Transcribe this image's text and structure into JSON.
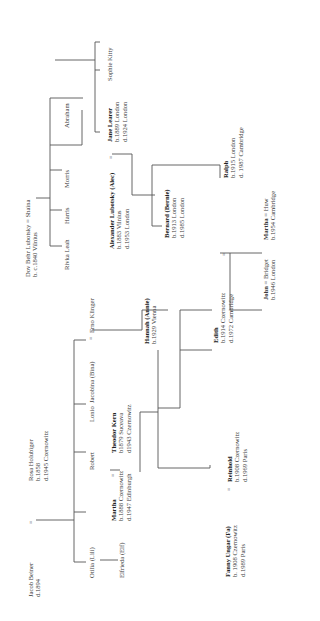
{
  "diagram": {
    "type": "family-tree",
    "orientation": "rotated-90-ccw",
    "persons": {
      "jacob_beiner": {
        "name": "Jacob Beiner",
        "lines": [
          "d.1894"
        ]
      },
      "rosa_holubiger": {
        "name": "Rosa Holubiger",
        "lines": [
          "b.1858",
          "d.1945 Czernowitz"
        ]
      },
      "otilia": {
        "name": "Otilia (Lili)",
        "lines": []
      },
      "elfrieda": {
        "name": "Elfrieda (Elf)",
        "lines": []
      },
      "martha": {
        "name": "Martha",
        "lines": [
          "b.1888 Czernowitz",
          "d.1947 Edinburgh"
        ]
      },
      "robert": {
        "name": "Robert",
        "lines": []
      },
      "lonio": {
        "name": "Lonio",
        "lines": []
      },
      "jacobina": {
        "name": "Jacobina (Bina)",
        "lines": []
      },
      "theodor_kern": {
        "name": "Theodor Kern",
        "lines": [
          "b1879 Suceava",
          "d1943 Czernowitz"
        ]
      },
      "erno_klinger": {
        "name": "Erno Klinger",
        "lines": []
      },
      "hannah": {
        "name": "Hannah (Annie)",
        "lines": [
          "b.1929 Vienna"
        ]
      },
      "fanny_ungar": {
        "name": "Fanny Ungar (Fa)",
        "lines": [
          "b. 1908 Czernowitz",
          "d.1989 Paris"
        ]
      },
      "reinhold": {
        "name": "Reinhold",
        "lines": [
          "b.1908 Czernowitz",
          "d.1969 Paris"
        ]
      },
      "edith": {
        "name": "Edith",
        "lines": [
          "b.1914 Czernowitz",
          "d.1972 Cambridge"
        ]
      },
      "john": {
        "name": "John",
        "lines": [
          "b.1946 London"
        ]
      },
      "bridget": {
        "name": "Bridget",
        "lines": []
      },
      "martha2": {
        "name": "Martha",
        "lines": [
          "b.1954 Cambridge"
        ]
      },
      "huw": {
        "name": "Huw",
        "lines": []
      },
      "dov_behr": {
        "name": "Dov Behr Lubotsky",
        "lines": [
          "b. c.1840 Vilnius"
        ]
      },
      "shaina": {
        "name": "Shaina",
        "lines": []
      },
      "rivka_leah": {
        "name": "Rivka Leah",
        "lines": []
      },
      "harris": {
        "name": "Harris",
        "lines": []
      },
      "morris": {
        "name": "Morris",
        "lines": []
      },
      "abraham": {
        "name": "Abraham",
        "lines": []
      },
      "alexander": {
        "name": "Alexander Lubotsky (Alec)",
        "lines": [
          "b.1883 Vilnius",
          "d.1953 London"
        ]
      },
      "jane_learer": {
        "name": "Jane Learer",
        "lines": [
          "b.1889 London",
          "d.1924 London"
        ]
      },
      "sophie_kitty": {
        "name": "Sophie Kitty",
        "lines": []
      },
      "bernard": {
        "name": "Bernard (Bernie)",
        "lines": [
          "b.1913 London",
          "d.1985 London"
        ]
      },
      "ralph": {
        "name": "Ralph",
        "lines": [
          "b.1915 London",
          "d. 1987 Cambridge"
        ]
      }
    },
    "marriage_symbol": "="
  }
}
